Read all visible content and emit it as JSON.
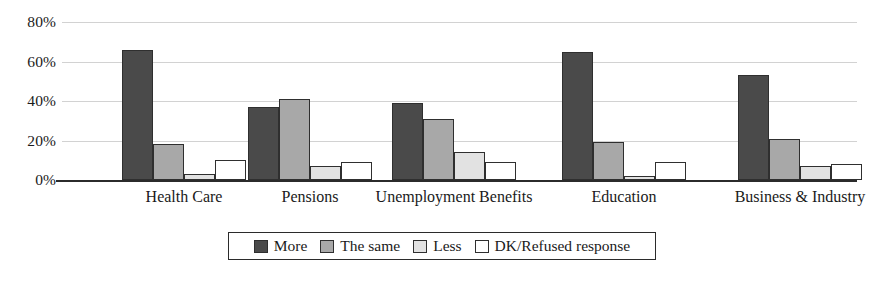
{
  "chart_data": {
    "type": "bar",
    "title": "",
    "subtitle": "",
    "xlabel": "",
    "ylabel": "",
    "ylim": [
      0,
      80
    ],
    "y_ticks": [
      "0%",
      "20%",
      "40%",
      "60%",
      "80%"
    ],
    "y_tick_values": [
      0,
      20,
      40,
      60,
      80
    ],
    "grid": true,
    "grid_axis": "y",
    "legend_position": "bottom",
    "categories": [
      "Health Care",
      "Pensions",
      "Unemployment Benefits",
      "Education",
      "Business & Industry"
    ],
    "series": [
      {
        "name": "More",
        "color": "#4a4a4a",
        "values": [
          66,
          37,
          39,
          65,
          53
        ]
      },
      {
        "name": "The same",
        "color": "#a8a8a8",
        "values": [
          18,
          41,
          31,
          19,
          21
        ]
      },
      {
        "name": "Less",
        "color": "#e2e2e2",
        "values": [
          3,
          7,
          14,
          2,
          7
        ]
      },
      {
        "name": "DK/Refused response",
        "color": "#ffffff",
        "values": [
          10,
          9,
          9,
          9,
          8
        ]
      }
    ]
  },
  "legend": {
    "items": [
      {
        "label": "More",
        "color": "#4a4a4a"
      },
      {
        "label": "The same",
        "color": "#a8a8a8"
      },
      {
        "label": "Less",
        "color": "#e2e2e2"
      },
      {
        "label": "DK/Refused response",
        "color": "#ffffff"
      }
    ]
  }
}
